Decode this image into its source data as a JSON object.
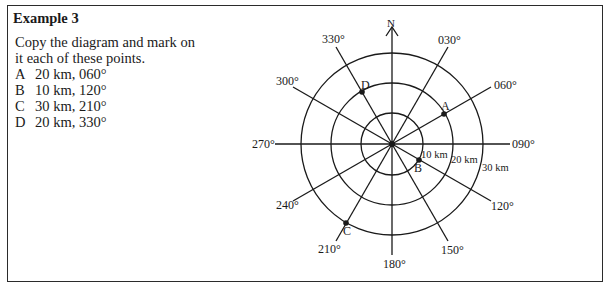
{
  "example": {
    "title": "Example 3",
    "instruction_line1": "Copy the diagram and mark on",
    "instruction_line2": "it each of these points.",
    "points": [
      {
        "label": "A",
        "text": "20 km, 060°"
      },
      {
        "label": "B",
        "text": "10 km, 120°"
      },
      {
        "label": "C",
        "text": "30 km, 210°"
      },
      {
        "label": "D",
        "text": "20 km, 330°"
      }
    ]
  },
  "diagram": {
    "north_label": "N",
    "bearing_labels": {
      "b030": "030°",
      "b060": "060°",
      "b090": "090°",
      "b120": "120°",
      "b150": "150°",
      "b180": "180°",
      "b210": "210°",
      "b240": "240°",
      "b270": "270°",
      "b300": "300°",
      "b330": "330°"
    },
    "ring_labels": {
      "r10": "10 km",
      "r20": "20 km",
      "r30": "30 km"
    },
    "point_labels": {
      "A": "A",
      "B": "B",
      "C": "C",
      "D": "D"
    }
  }
}
